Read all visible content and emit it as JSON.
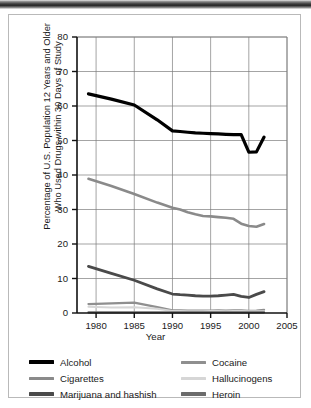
{
  "figure": {
    "ylabel_line1": "Percentage of U.S. Population 12 Years and Older",
    "ylabel_line2": "Who Used Drugs within 30 Days of Study",
    "xlabel": "Year"
  },
  "legend": {
    "items": [
      {
        "label": "Alcohol",
        "color": "#000000",
        "thick": true
      },
      {
        "label": "Cocaine",
        "color": "#8f8f8f",
        "thick": false
      },
      {
        "label": "Cigarettes",
        "color": "#8a8a8a",
        "thick": false
      },
      {
        "label": "Hallucinogens",
        "color": "#d6d6d6",
        "thick": false
      },
      {
        "label": "Marijuana and hashish",
        "color": "#4a4a4a",
        "thick": true
      },
      {
        "label": "Heroin",
        "color": "#6b6b6b",
        "thick": true
      }
    ]
  },
  "chart_data": {
    "type": "line",
    "title": "",
    "xlabel": "Year",
    "ylabel": "Percentage of U.S. Population 12 Years and Older Who Used Drugs within 30 Days of Study",
    "xlim": [
      1977.5,
      2005
    ],
    "ylim": [
      0,
      80
    ],
    "xticks": [
      1980,
      1985,
      1990,
      1995,
      2000,
      2005
    ],
    "yticks": [
      0,
      10,
      20,
      30,
      40,
      50,
      60,
      70,
      80
    ],
    "grid": true,
    "legend_position": "below-axes",
    "series": [
      {
        "name": "Alcohol",
        "color": "#000000",
        "width": 3.2,
        "x": [
          1979,
          1982,
          1985,
          1988,
          1990,
          1991,
          1992,
          1993,
          1994,
          1995,
          1996,
          1997,
          1998,
          1999,
          2000,
          2001,
          2002
        ],
        "y": [
          63.5,
          62.0,
          60.3,
          56.0,
          52.8,
          52.6,
          52.4,
          52.2,
          52.1,
          52.0,
          51.9,
          51.8,
          51.7,
          51.7,
          46.6,
          46.7,
          51.0
        ]
      },
      {
        "name": "Cigarettes",
        "color": "#8a8a8a",
        "width": 2.6,
        "x": [
          1979,
          1982,
          1985,
          1988,
          1990,
          1991,
          1992,
          1993,
          1994,
          1995,
          1996,
          1997,
          1998,
          1999,
          2000,
          2001,
          2002
        ],
        "y": [
          38.9,
          36.8,
          34.5,
          32.0,
          30.5,
          30.0,
          29.2,
          28.6,
          28.1,
          28.0,
          27.8,
          27.6,
          27.3,
          25.9,
          25.2,
          25.0,
          25.8
        ]
      },
      {
        "name": "Marijuana and hashish",
        "color": "#4a4a4a",
        "width": 2.8,
        "x": [
          1979,
          1982,
          1985,
          1988,
          1990,
          1991,
          1992,
          1993,
          1994,
          1995,
          1996,
          1997,
          1998,
          1999,
          2000,
          2001,
          2002
        ],
        "y": [
          13.5,
          11.5,
          9.5,
          7.0,
          5.5,
          5.3,
          5.2,
          5.0,
          4.9,
          4.9,
          5.0,
          5.2,
          5.4,
          4.8,
          4.5,
          5.4,
          6.2
        ]
      },
      {
        "name": "Cocaine",
        "color": "#8f8f8f",
        "width": 2.2,
        "x": [
          1979,
          1982,
          1985,
          1988,
          1990,
          1991,
          1992,
          1993,
          1994,
          1995,
          1996,
          1997,
          1998,
          1999,
          2000,
          2001,
          2002
        ],
        "y": [
          2.6,
          2.8,
          3.0,
          1.7,
          0.8,
          0.8,
          0.7,
          0.7,
          0.7,
          0.7,
          0.8,
          0.7,
          0.8,
          0.8,
          0.6,
          0.7,
          0.9
        ]
      },
      {
        "name": "Hallucinogens",
        "color": "#d6d6d6",
        "width": 2.0,
        "x": [
          1979,
          1982,
          1985,
          1988,
          1990,
          1991,
          1992,
          1993,
          1994,
          1995,
          1996,
          1997,
          1998,
          1999,
          2000,
          2001,
          2002
        ],
        "y": [
          1.8,
          1.6,
          1.7,
          1.2,
          0.6,
          0.6,
          0.5,
          0.5,
          0.5,
          0.6,
          0.6,
          0.5,
          0.6,
          0.6,
          0.5,
          0.5,
          0.5
        ]
      },
      {
        "name": "Heroin",
        "color": "#6b6b6b",
        "width": 2.2,
        "x": [
          1979,
          1982,
          1985,
          1988,
          1990,
          1991,
          1992,
          1993,
          1994,
          1995,
          1996,
          1997,
          1998,
          1999,
          2000,
          2001,
          2002
        ],
        "y": [
          0.2,
          0.2,
          0.2,
          0.2,
          0.2,
          0.2,
          0.2,
          0.2,
          0.2,
          0.2,
          0.2,
          0.2,
          0.2,
          0.2,
          0.2,
          0.2,
          0.2
        ]
      }
    ]
  }
}
